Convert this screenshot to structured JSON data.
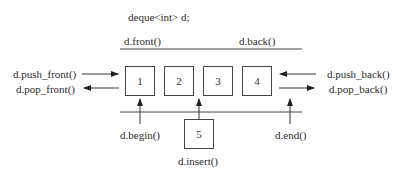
{
  "title": "deque<int> d;",
  "top_labels": {
    "front": "d.front()",
    "back": "d.back()"
  },
  "left_labels": {
    "push_front": "d.push_front()",
    "pop_front": "d.pop_front()"
  },
  "right_labels": {
    "push_back": "d.push_back()",
    "pop_back": "d.pop_back()"
  },
  "elements": [
    "1",
    "2",
    "3",
    "4"
  ],
  "insert_element": "5",
  "bottom_labels": {
    "begin": "d.begin()",
    "insert": "d.insert()",
    "end": "d.end()"
  }
}
